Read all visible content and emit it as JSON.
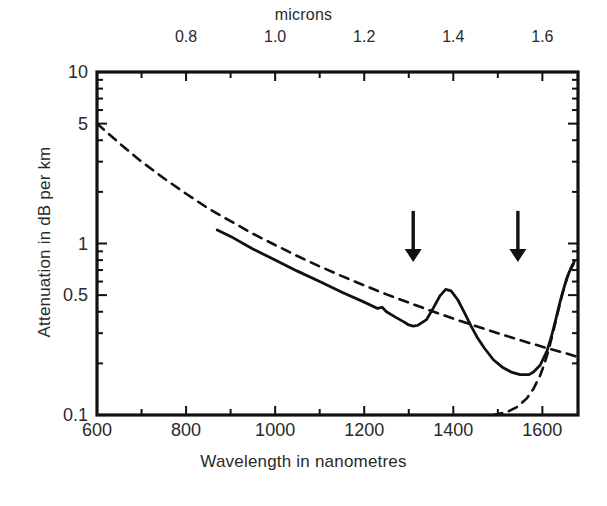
{
  "chart_data": {
    "type": "line",
    "title": "",
    "xlabel": "Wavelength in nanometres",
    "ylabel": "Attenuation in dB per km",
    "top_axis_label": "microns",
    "xlim": [
      600,
      1680
    ],
    "ylim": [
      0.1,
      10
    ],
    "yscale": "log",
    "xscale": "linear",
    "grid": false,
    "legend": "none",
    "x_ticks": [
      "600",
      "800",
      "1000",
      "1200",
      "1400",
      "1600"
    ],
    "x_tick_values": [
      600,
      800,
      1000,
      1200,
      1400,
      1600
    ],
    "x_minor_tick_values": [
      700,
      900,
      1100,
      1300,
      1500
    ],
    "top_ticks": [
      "0.8",
      "1.0",
      "1.2",
      "1.4",
      "1.6"
    ],
    "top_tick_values": [
      800,
      1000,
      1200,
      1400,
      1600
    ],
    "y_ticks": [
      "10",
      "5",
      "1",
      "0.5",
      "0.1"
    ],
    "y_tick_values": [
      10,
      5,
      1,
      0.5,
      0.1
    ],
    "y_minor_tick_values": [
      9,
      8,
      7,
      6,
      4,
      3,
      2,
      0.9,
      0.8,
      0.7,
      0.6,
      0.4,
      0.3,
      0.2
    ],
    "series": [
      {
        "name": "total-attenuation",
        "style": "solid",
        "points": [
          [
            870,
            1.2
          ],
          [
            900,
            1.1
          ],
          [
            950,
            0.93
          ],
          [
            1000,
            0.8
          ],
          [
            1050,
            0.69
          ],
          [
            1100,
            0.6
          ],
          [
            1150,
            0.52
          ],
          [
            1200,
            0.455
          ],
          [
            1230,
            0.418
          ],
          [
            1240,
            0.425
          ],
          [
            1250,
            0.4
          ],
          [
            1270,
            0.372
          ],
          [
            1290,
            0.348
          ],
          [
            1300,
            0.335
          ],
          [
            1310,
            0.33
          ],
          [
            1320,
            0.333
          ],
          [
            1340,
            0.36
          ],
          [
            1355,
            0.42
          ],
          [
            1370,
            0.495
          ],
          [
            1383,
            0.54
          ],
          [
            1395,
            0.53
          ],
          [
            1410,
            0.47
          ],
          [
            1425,
            0.395
          ],
          [
            1440,
            0.33
          ],
          [
            1455,
            0.28
          ],
          [
            1470,
            0.245
          ],
          [
            1490,
            0.21
          ],
          [
            1510,
            0.19
          ],
          [
            1530,
            0.178
          ],
          [
            1550,
            0.172
          ],
          [
            1570,
            0.172
          ],
          [
            1580,
            0.178
          ],
          [
            1595,
            0.195
          ],
          [
            1610,
            0.235
          ],
          [
            1620,
            0.285
          ],
          [
            1630,
            0.36
          ],
          [
            1640,
            0.46
          ],
          [
            1650,
            0.57
          ],
          [
            1660,
            0.68
          ],
          [
            1670,
            0.76
          ]
        ]
      },
      {
        "name": "rayleigh-scattering",
        "style": "dashed",
        "points": [
          [
            600,
            5.0
          ],
          [
            650,
            3.85
          ],
          [
            700,
            3.0
          ],
          [
            750,
            2.4
          ],
          [
            800,
            1.95
          ],
          [
            850,
            1.6
          ],
          [
            900,
            1.35
          ],
          [
            950,
            1.14
          ],
          [
            1000,
            0.98
          ],
          [
            1050,
            0.845
          ],
          [
            1100,
            0.735
          ],
          [
            1150,
            0.645
          ],
          [
            1200,
            0.57
          ],
          [
            1250,
            0.505
          ],
          [
            1300,
            0.452
          ],
          [
            1350,
            0.405
          ],
          [
            1400,
            0.365
          ],
          [
            1450,
            0.33
          ],
          [
            1500,
            0.3
          ],
          [
            1550,
            0.273
          ],
          [
            1600,
            0.25
          ],
          [
            1650,
            0.23
          ],
          [
            1680,
            0.218
          ]
        ]
      },
      {
        "name": "infrared-absorption",
        "style": "dashed",
        "points": [
          [
            1490,
            0.1
          ],
          [
            1520,
            0.104
          ],
          [
            1545,
            0.112
          ],
          [
            1565,
            0.125
          ],
          [
            1580,
            0.142
          ],
          [
            1595,
            0.17
          ],
          [
            1605,
            0.2
          ],
          [
            1615,
            0.245
          ],
          [
            1625,
            0.31
          ],
          [
            1635,
            0.4
          ],
          [
            1645,
            0.51
          ],
          [
            1655,
            0.63
          ],
          [
            1665,
            0.73
          ],
          [
            1672,
            0.79
          ]
        ]
      }
    ],
    "annotations": [
      {
        "name": "arrow-1310nm",
        "type": "down-arrow",
        "x": 1310,
        "y_top": 1.55,
        "y_tip": 0.78
      },
      {
        "name": "arrow-1550nm",
        "type": "down-arrow",
        "x": 1545,
        "y_top": 1.55,
        "y_tip": 0.78
      }
    ]
  }
}
